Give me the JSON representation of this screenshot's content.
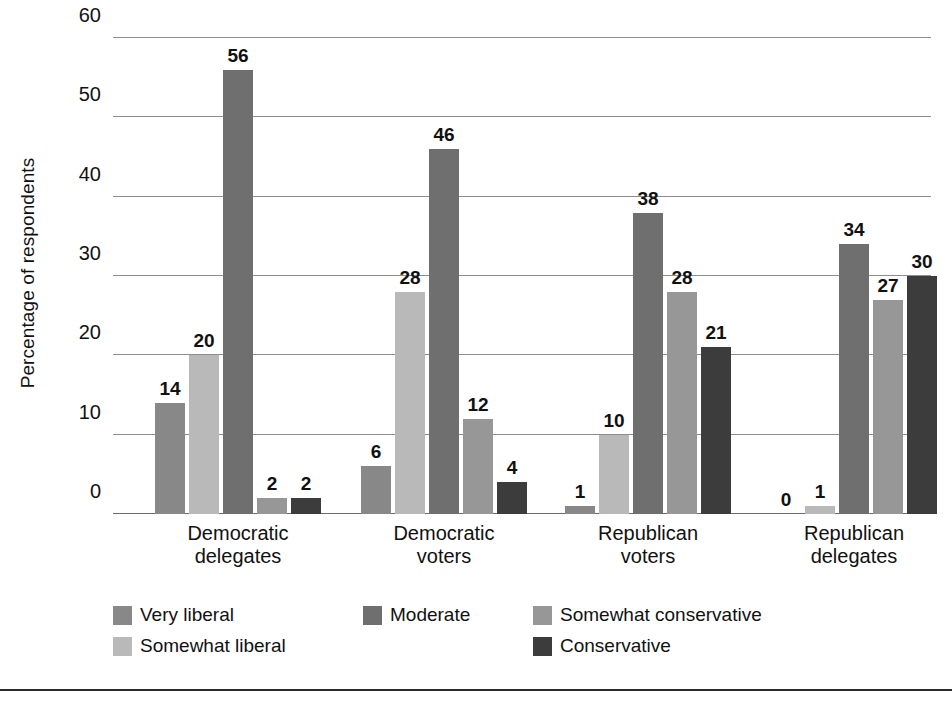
{
  "chart_data": {
    "type": "bar",
    "title": "",
    "xlabel": "",
    "ylabel": "Percentage of respondents",
    "ylim": [
      0,
      60
    ],
    "yticks": [
      0,
      10,
      20,
      30,
      40,
      50,
      60
    ],
    "grid": true,
    "legend_position": "bottom",
    "categories": [
      "Democratic delegates",
      "Democratic voters",
      "Republican voters",
      "Republican delegates"
    ],
    "category_lines": [
      [
        "Democratic",
        "delegates"
      ],
      [
        "Democratic",
        "voters"
      ],
      [
        "Republican",
        "voters"
      ],
      [
        "Republican",
        "delegates"
      ]
    ],
    "series": [
      {
        "name": "Very liberal",
        "color": "#888888",
        "values": [
          14,
          6,
          1,
          0
        ]
      },
      {
        "name": "Somewhat liberal",
        "color": "#b9b9b9",
        "values": [
          20,
          28,
          10,
          1
        ]
      },
      {
        "name": "Moderate",
        "color": "#6f6f6f",
        "values": [
          56,
          46,
          38,
          34
        ]
      },
      {
        "name": "Somewhat conservative",
        "color": "#979797",
        "values": [
          2,
          12,
          28,
          27
        ]
      },
      {
        "name": "Conservative",
        "color": "#3c3c3c",
        "values": [
          2,
          4,
          21,
          30
        ]
      }
    ],
    "legend_order": [
      "Very liberal",
      "Moderate",
      "Somewhat conservative",
      "Somewhat liberal",
      "Conservative"
    ]
  },
  "colors": {
    "very_liberal": "#888888",
    "somewhat_liberal": "#b9b9b9",
    "moderate": "#6f6f6f",
    "somewhat_conservative": "#979797",
    "conservative": "#3c3c3c",
    "gridline": "#8e8e8e",
    "axis": "#6d6d6d",
    "text": "#111111",
    "background": "#ffffff"
  }
}
